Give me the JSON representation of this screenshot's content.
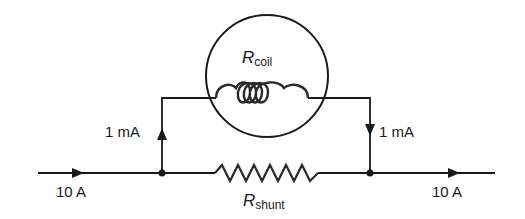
{
  "diagram": {
    "type": "circuit",
    "components": {
      "coil": {
        "symbol": "R",
        "subscript": "coil",
        "kind": "inductor-coil",
        "enclosed_in": "meter-circle"
      },
      "shunt": {
        "symbol": "R",
        "subscript": "shunt",
        "kind": "resistor"
      }
    },
    "currents": {
      "input": "10 A",
      "output": "10 A",
      "coil_in": "1 mA",
      "coil_out": "1 mA"
    },
    "colors": {
      "line": "#1a1a1a",
      "background": "#ffffff"
    }
  }
}
